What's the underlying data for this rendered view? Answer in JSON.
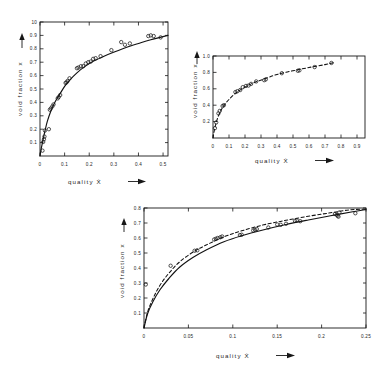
{
  "figure": {
    "background_color": "#ffffff",
    "ink_color": "#171717",
    "panel_count": 3
  },
  "chart_data": [
    {
      "id": "panel-top-left",
      "type": "scatter",
      "title": "",
      "xlabel": "quality  Ẋ",
      "ylabel": "void fraction x",
      "xlim": [
        0,
        0.52
      ],
      "ylim": [
        0,
        1.0
      ],
      "grid": false,
      "legend": null,
      "xticks": [
        0,
        0.1,
        0.2,
        0.3,
        0.4,
        0.5
      ],
      "xticklabels": [
        "0",
        "0.1",
        "0.2",
        "0.3",
        "0.4",
        "0.5"
      ],
      "yticks": [
        0.1,
        0.2,
        0.3,
        0.4,
        0.5,
        0.6,
        0.7,
        0.8,
        0.9,
        1.0
      ],
      "yticklabels": [
        "0.1",
        "0.2",
        "0.3",
        "0.4",
        "0.5",
        "0.6",
        "0.7",
        "0.8",
        "0.9",
        "10"
      ],
      "series": [
        {
          "name": "measured data",
          "style": "open-circle-markers",
          "x": [
            0.01,
            0.013,
            0.016,
            0.018,
            0.02,
            0.036,
            0.04,
            0.044,
            0.05,
            0.055,
            0.072,
            0.076,
            0.082,
            0.104,
            0.108,
            0.112,
            0.12,
            0.15,
            0.156,
            0.166,
            0.176,
            0.186,
            0.196,
            0.206,
            0.216,
            0.226,
            0.246,
            0.29,
            0.33,
            0.345,
            0.365,
            0.44,
            0.45,
            0.462,
            0.49
          ],
          "y": [
            0.04,
            0.105,
            0.125,
            0.145,
            0.19,
            0.2,
            0.345,
            0.355,
            0.37,
            0.385,
            0.43,
            0.44,
            0.455,
            0.545,
            0.55,
            0.56,
            0.58,
            0.655,
            0.66,
            0.67,
            0.67,
            0.69,
            0.7,
            0.705,
            0.725,
            0.73,
            0.745,
            0.79,
            0.85,
            0.83,
            0.84,
            0.895,
            0.9,
            0.895,
            0.885
          ]
        },
        {
          "name": "correlation curve",
          "style": "solid-line",
          "x": [
            0.0,
            0.005,
            0.01,
            0.02,
            0.03,
            0.045,
            0.06,
            0.08,
            0.1,
            0.12,
            0.15,
            0.18,
            0.22,
            0.26,
            0.3,
            0.35,
            0.4,
            0.45,
            0.52
          ],
          "y": [
            0.0,
            0.055,
            0.1,
            0.185,
            0.26,
            0.34,
            0.4,
            0.46,
            0.52,
            0.565,
            0.62,
            0.665,
            0.71,
            0.745,
            0.775,
            0.81,
            0.84,
            0.868,
            0.9
          ]
        }
      ]
    },
    {
      "id": "panel-top-right",
      "type": "scatter",
      "title": "",
      "xlabel": "quality  Ẋ",
      "ylabel": "void fraction x",
      "xlim": [
        0,
        0.95
      ],
      "ylim": [
        0,
        1.0
      ],
      "grid": false,
      "legend": null,
      "xticks": [
        0,
        0.1,
        0.2,
        0.3,
        0.4,
        0.5,
        0.6,
        0.7,
        0.8,
        0.9
      ],
      "xticklabels": [
        "0",
        "0.1",
        "0.2",
        "0.3",
        "0.4",
        "0.5",
        "0.6",
        "0.7",
        "0.8",
        "0.9"
      ],
      "yticks": [
        0.2,
        0.4,
        0.6,
        0.8,
        1.0
      ],
      "yticklabels": [
        "0.2",
        "0.4",
        "0.6",
        "0.8",
        "1.0"
      ],
      "series": [
        {
          "name": "measured data",
          "style": "open-circle-markers",
          "x": [
            0.012,
            0.02,
            0.034,
            0.042,
            0.06,
            0.068,
            0.14,
            0.152,
            0.17,
            0.186,
            0.206,
            0.222,
            0.238,
            0.27,
            0.32,
            0.33,
            0.43,
            0.53,
            0.54,
            0.635,
            0.74
          ],
          "y": [
            0.12,
            0.19,
            0.3,
            0.33,
            0.39,
            0.4,
            0.56,
            0.57,
            0.585,
            0.62,
            0.635,
            0.64,
            0.66,
            0.69,
            0.705,
            0.715,
            0.79,
            0.82,
            0.825,
            0.865,
            0.915
          ]
        },
        {
          "name": "correlation curve",
          "style": "dashed-line",
          "x": [
            0.0,
            0.01,
            0.025,
            0.045,
            0.07,
            0.1,
            0.14,
            0.19,
            0.25,
            0.32,
            0.4,
            0.5,
            0.6,
            0.7,
            0.76
          ],
          "y": [
            0.0,
            0.11,
            0.22,
            0.32,
            0.4,
            0.47,
            0.545,
            0.61,
            0.67,
            0.72,
            0.775,
            0.82,
            0.86,
            0.895,
            0.92
          ]
        }
      ]
    },
    {
      "id": "panel-bottom",
      "type": "scatter",
      "title": "",
      "xlabel": "quality  Ẋ",
      "ylabel": "void fraction x",
      "xlim": [
        0,
        0.25
      ],
      "ylim": [
        0,
        0.8
      ],
      "grid": false,
      "legend": null,
      "xticks": [
        0,
        0.05,
        0.1,
        0.15,
        0.2,
        0.25
      ],
      "xticklabels": [
        "0",
        "0.05",
        "0.1",
        "0.15",
        "0.2",
        "0.25"
      ],
      "yticks": [
        0.1,
        0.2,
        0.3,
        0.4,
        0.5,
        0.6,
        0.7,
        0.8
      ],
      "yticklabels": [
        "0.1",
        "0.2",
        "0.3",
        "0.4",
        "0.5",
        "0.6",
        "0.7",
        "0.8"
      ],
      "series": [
        {
          "name": "measured data",
          "style": "open-circle-markers",
          "x": [
            0.002,
            0.03,
            0.057,
            0.06,
            0.079,
            0.081,
            0.083,
            0.086,
            0.088,
            0.108,
            0.11,
            0.123,
            0.125,
            0.127,
            0.14,
            0.15,
            0.154,
            0.16,
            0.17,
            0.172,
            0.176,
            0.215,
            0.217,
            0.218,
            0.219,
            0.22,
            0.238
          ],
          "y": [
            0.29,
            0.415,
            0.515,
            0.518,
            0.59,
            0.595,
            0.6,
            0.605,
            0.61,
            0.62,
            0.622,
            0.65,
            0.655,
            0.66,
            0.67,
            0.69,
            0.688,
            0.695,
            0.715,
            0.718,
            0.712,
            0.76,
            0.755,
            0.748,
            0.742,
            0.77,
            0.765
          ]
        },
        {
          "name": "correlation curve A",
          "style": "solid-line",
          "x": [
            0.0,
            0.004,
            0.01,
            0.018,
            0.028,
            0.04,
            0.055,
            0.07,
            0.09,
            0.11,
            0.135,
            0.16,
            0.185,
            0.21,
            0.235,
            0.25
          ],
          "y": [
            0.0,
            0.095,
            0.175,
            0.255,
            0.33,
            0.405,
            0.47,
            0.52,
            0.575,
            0.615,
            0.655,
            0.69,
            0.72,
            0.748,
            0.775,
            0.79
          ]
        },
        {
          "name": "correlation curve B",
          "style": "dashed-line",
          "x": [
            0.0,
            0.004,
            0.01,
            0.018,
            0.028,
            0.04,
            0.055,
            0.07,
            0.09,
            0.11,
            0.135,
            0.16,
            0.185,
            0.21,
            0.232,
            0.25
          ],
          "y": [
            0.0,
            0.105,
            0.195,
            0.285,
            0.365,
            0.44,
            0.505,
            0.553,
            0.608,
            0.648,
            0.688,
            0.718,
            0.745,
            0.768,
            0.788,
            0.792
          ]
        }
      ]
    }
  ]
}
